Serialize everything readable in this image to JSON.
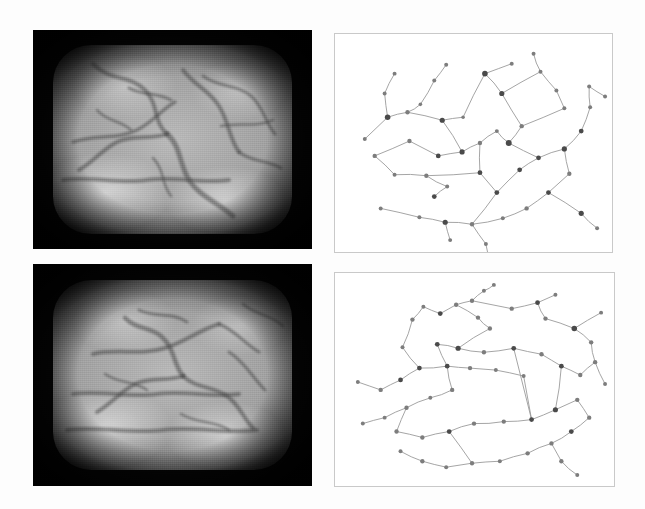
{
  "figure": {
    "background_color": "#fdfdfd",
    "layout": "2x2",
    "columns": 2,
    "rows": 2,
    "panels": [
      {
        "id": "top-left",
        "kind": "grayscale-image",
        "label": "top-left grayscale specimen image",
        "x": 33,
        "y": 30,
        "width": 279,
        "height": 219,
        "border_color": "#050505",
        "interior_color": "#a8a8a8"
      },
      {
        "id": "top-right",
        "kind": "graph",
        "label": "top-right extracted graph",
        "x": 334,
        "y": 33,
        "width": 279,
        "height": 220,
        "border_color": "#c9c9c9",
        "background_color": "#ffffff",
        "node_color": "#4a4a4a",
        "edge_color": "#9a9a9a"
      },
      {
        "id": "bottom-left",
        "kind": "grayscale-image",
        "label": "bottom-left grayscale specimen image",
        "x": 33,
        "y": 264,
        "width": 279,
        "height": 222,
        "border_color": "#050505",
        "interior_color": "#a8a8a8"
      },
      {
        "id": "bottom-right",
        "kind": "graph",
        "label": "bottom-right extracted graph",
        "x": 334,
        "y": 272,
        "width": 281,
        "height": 215,
        "border_color": "#c9c9c9",
        "background_color": "#ffffff",
        "node_color": "#4a4a4a",
        "edge_color": "#9a9a9a"
      }
    ]
  },
  "chart_data": [
    {
      "type": "scatter",
      "id": "top-right-graph",
      "title": "",
      "xlabel": "",
      "ylabel": "",
      "xlim": [
        0,
        279
      ],
      "ylim": [
        0,
        220
      ],
      "grid": false,
      "legend": "none",
      "nodes": [
        {
          "id": 0,
          "x": 30,
          "y": 106,
          "size": 2.0
        },
        {
          "id": 1,
          "x": 53,
          "y": 84,
          "size": 2.8
        },
        {
          "id": 2,
          "x": 50,
          "y": 60,
          "size": 2.0
        },
        {
          "id": 3,
          "x": 60,
          "y": 40,
          "size": 2.0
        },
        {
          "id": 4,
          "x": 73,
          "y": 79,
          "size": 2.2
        },
        {
          "id": 5,
          "x": 86,
          "y": 71,
          "size": 1.8
        },
        {
          "id": 6,
          "x": 100,
          "y": 47,
          "size": 2.0
        },
        {
          "id": 7,
          "x": 112,
          "y": 31,
          "size": 2.0
        },
        {
          "id": 8,
          "x": 108,
          "y": 87,
          "size": 2.6
        },
        {
          "id": 9,
          "x": 129,
          "y": 84,
          "size": 1.8
        },
        {
          "id": 10,
          "x": 151,
          "y": 40,
          "size": 2.8
        },
        {
          "id": 11,
          "x": 168,
          "y": 60,
          "size": 2.6
        },
        {
          "id": 12,
          "x": 178,
          "y": 30,
          "size": 2.0
        },
        {
          "id": 13,
          "x": 207,
          "y": 38,
          "size": 2.0
        },
        {
          "id": 14,
          "x": 223,
          "y": 57,
          "size": 2.0
        },
        {
          "id": 15,
          "x": 231,
          "y": 75,
          "size": 2.0
        },
        {
          "id": 16,
          "x": 188,
          "y": 93,
          "size": 2.2
        },
        {
          "id": 17,
          "x": 175,
          "y": 110,
          "size": 3.0
        },
        {
          "id": 18,
          "x": 163,
          "y": 98,
          "size": 2.0
        },
        {
          "id": 19,
          "x": 146,
          "y": 110,
          "size": 2.2
        },
        {
          "id": 20,
          "x": 128,
          "y": 119,
          "size": 2.6
        },
        {
          "id": 21,
          "x": 104,
          "y": 123,
          "size": 2.4
        },
        {
          "id": 22,
          "x": 75,
          "y": 108,
          "size": 2.2
        },
        {
          "id": 23,
          "x": 40,
          "y": 123,
          "size": 2.2
        },
        {
          "id": 24,
          "x": 60,
          "y": 142,
          "size": 2.0
        },
        {
          "id": 25,
          "x": 92,
          "y": 143,
          "size": 2.2
        },
        {
          "id": 26,
          "x": 113,
          "y": 154,
          "size": 2.0
        },
        {
          "id": 27,
          "x": 100,
          "y": 164,
          "size": 2.4
        },
        {
          "id": 28,
          "x": 146,
          "y": 140,
          "size": 2.4
        },
        {
          "id": 29,
          "x": 163,
          "y": 160,
          "size": 2.4
        },
        {
          "id": 30,
          "x": 186,
          "y": 137,
          "size": 2.4
        },
        {
          "id": 31,
          "x": 205,
          "y": 125,
          "size": 2.4
        },
        {
          "id": 32,
          "x": 231,
          "y": 116,
          "size": 2.6
        },
        {
          "id": 33,
          "x": 248,
          "y": 98,
          "size": 2.4
        },
        {
          "id": 34,
          "x": 257,
          "y": 74,
          "size": 2.0
        },
        {
          "id": 35,
          "x": 236,
          "y": 141,
          "size": 2.2
        },
        {
          "id": 36,
          "x": 215,
          "y": 160,
          "size": 2.4
        },
        {
          "id": 37,
          "x": 193,
          "y": 176,
          "size": 2.2
        },
        {
          "id": 38,
          "x": 169,
          "y": 186,
          "size": 2.0
        },
        {
          "id": 39,
          "x": 138,
          "y": 192,
          "size": 2.2
        },
        {
          "id": 40,
          "x": 111,
          "y": 190,
          "size": 2.6
        },
        {
          "id": 41,
          "x": 85,
          "y": 185,
          "size": 2.0
        },
        {
          "id": 42,
          "x": 46,
          "y": 176,
          "size": 2.0
        },
        {
          "id": 43,
          "x": 116,
          "y": 208,
          "size": 2.0
        },
        {
          "id": 44,
          "x": 152,
          "y": 212,
          "size": 2.0
        },
        {
          "id": 45,
          "x": 155,
          "y": 232,
          "size": 2.0
        },
        {
          "id": 46,
          "x": 248,
          "y": 181,
          "size": 2.6
        },
        {
          "id": 47,
          "x": 264,
          "y": 196,
          "size": 2.0
        },
        {
          "id": 48,
          "x": 256,
          "y": 53,
          "size": 2.0
        },
        {
          "id": 49,
          "x": 272,
          "y": 63,
          "size": 2.0
        },
        {
          "id": 50,
          "x": 200,
          "y": 20,
          "size": 2.0
        }
      ],
      "edges": [
        [
          0,
          1
        ],
        [
          1,
          2
        ],
        [
          2,
          3
        ],
        [
          1,
          4
        ],
        [
          4,
          5
        ],
        [
          5,
          6
        ],
        [
          6,
          7
        ],
        [
          4,
          8
        ],
        [
          8,
          9
        ],
        [
          9,
          10
        ],
        [
          10,
          11
        ],
        [
          10,
          12
        ],
        [
          11,
          13
        ],
        [
          13,
          14
        ],
        [
          14,
          15
        ],
        [
          15,
          16
        ],
        [
          11,
          16
        ],
        [
          16,
          17
        ],
        [
          17,
          18
        ],
        [
          18,
          19
        ],
        [
          19,
          20
        ],
        [
          20,
          21
        ],
        [
          21,
          22
        ],
        [
          22,
          23
        ],
        [
          23,
          24
        ],
        [
          24,
          25
        ],
        [
          25,
          26
        ],
        [
          26,
          27
        ],
        [
          25,
          28
        ],
        [
          28,
          29
        ],
        [
          29,
          30
        ],
        [
          30,
          31
        ],
        [
          31,
          32
        ],
        [
          32,
          33
        ],
        [
          33,
          34
        ],
        [
          34,
          48
        ],
        [
          48,
          49
        ],
        [
          32,
          35
        ],
        [
          35,
          36
        ],
        [
          36,
          37
        ],
        [
          37,
          38
        ],
        [
          38,
          39
        ],
        [
          39,
          40
        ],
        [
          40,
          41
        ],
        [
          41,
          42
        ],
        [
          40,
          43
        ],
        [
          39,
          44
        ],
        [
          44,
          45
        ],
        [
          36,
          46
        ],
        [
          46,
          47
        ],
        [
          17,
          31
        ],
        [
          8,
          20
        ],
        [
          13,
          50
        ],
        [
          28,
          19
        ],
        [
          29,
          39
        ]
      ]
    },
    {
      "type": "scatter",
      "id": "bottom-right-graph",
      "title": "",
      "xlabel": "",
      "ylabel": "",
      "xlim": [
        0,
        281
      ],
      "ylim": [
        0,
        215
      ],
      "grid": false,
      "legend": "none",
      "nodes": [
        {
          "id": 0,
          "x": 23,
          "y": 110,
          "size": 2.0
        },
        {
          "id": 1,
          "x": 46,
          "y": 118,
          "size": 2.2
        },
        {
          "id": 2,
          "x": 66,
          "y": 108,
          "size": 2.4
        },
        {
          "id": 3,
          "x": 85,
          "y": 96,
          "size": 2.4
        },
        {
          "id": 4,
          "x": 68,
          "y": 75,
          "size": 2.0
        },
        {
          "id": 5,
          "x": 78,
          "y": 47,
          "size": 2.2
        },
        {
          "id": 6,
          "x": 89,
          "y": 34,
          "size": 2.0
        },
        {
          "id": 7,
          "x": 106,
          "y": 41,
          "size": 2.4
        },
        {
          "id": 8,
          "x": 122,
          "y": 32,
          "size": 2.2
        },
        {
          "id": 9,
          "x": 138,
          "y": 28,
          "size": 2.2
        },
        {
          "id": 10,
          "x": 150,
          "y": 18,
          "size": 2.0
        },
        {
          "id": 11,
          "x": 144,
          "y": 45,
          "size": 2.2
        },
        {
          "id": 12,
          "x": 156,
          "y": 56,
          "size": 2.2
        },
        {
          "id": 13,
          "x": 178,
          "y": 36,
          "size": 2.2
        },
        {
          "id": 14,
          "x": 204,
          "y": 30,
          "size": 2.4
        },
        {
          "id": 15,
          "x": 222,
          "y": 22,
          "size": 2.0
        },
        {
          "id": 16,
          "x": 212,
          "y": 46,
          "size": 2.2
        },
        {
          "id": 17,
          "x": 241,
          "y": 56,
          "size": 2.8
        },
        {
          "id": 18,
          "x": 258,
          "y": 70,
          "size": 2.2
        },
        {
          "id": 19,
          "x": 262,
          "y": 90,
          "size": 2.2
        },
        {
          "id": 20,
          "x": 247,
          "y": 103,
          "size": 2.2
        },
        {
          "id": 21,
          "x": 228,
          "y": 94,
          "size": 2.4
        },
        {
          "id": 22,
          "x": 208,
          "y": 82,
          "size": 2.2
        },
        {
          "id": 23,
          "x": 180,
          "y": 76,
          "size": 2.4
        },
        {
          "id": 24,
          "x": 150,
          "y": 80,
          "size": 2.2
        },
        {
          "id": 25,
          "x": 124,
          "y": 76,
          "size": 2.6
        },
        {
          "id": 26,
          "x": 103,
          "y": 72,
          "size": 2.4
        },
        {
          "id": 27,
          "x": 113,
          "y": 94,
          "size": 2.4
        },
        {
          "id": 28,
          "x": 136,
          "y": 96,
          "size": 2.2
        },
        {
          "id": 29,
          "x": 162,
          "y": 98,
          "size": 2.0
        },
        {
          "id": 30,
          "x": 190,
          "y": 104,
          "size": 2.0
        },
        {
          "id": 31,
          "x": 118,
          "y": 118,
          "size": 2.2
        },
        {
          "id": 32,
          "x": 96,
          "y": 126,
          "size": 2.0
        },
        {
          "id": 33,
          "x": 72,
          "y": 136,
          "size": 2.2
        },
        {
          "id": 34,
          "x": 50,
          "y": 146,
          "size": 2.0
        },
        {
          "id": 35,
          "x": 28,
          "y": 152,
          "size": 2.0
        },
        {
          "id": 36,
          "x": 62,
          "y": 160,
          "size": 2.2
        },
        {
          "id": 37,
          "x": 88,
          "y": 166,
          "size": 2.2
        },
        {
          "id": 38,
          "x": 115,
          "y": 160,
          "size": 2.4
        },
        {
          "id": 39,
          "x": 140,
          "y": 152,
          "size": 2.2
        },
        {
          "id": 40,
          "x": 170,
          "y": 150,
          "size": 2.2
        },
        {
          "id": 41,
          "x": 198,
          "y": 148,
          "size": 2.4
        },
        {
          "id": 42,
          "x": 222,
          "y": 138,
          "size": 2.6
        },
        {
          "id": 43,
          "x": 244,
          "y": 128,
          "size": 2.2
        },
        {
          "id": 44,
          "x": 256,
          "y": 146,
          "size": 2.2
        },
        {
          "id": 45,
          "x": 238,
          "y": 160,
          "size": 2.4
        },
        {
          "id": 46,
          "x": 218,
          "y": 172,
          "size": 2.2
        },
        {
          "id": 47,
          "x": 194,
          "y": 182,
          "size": 2.2
        },
        {
          "id": 48,
          "x": 166,
          "y": 190,
          "size": 2.0
        },
        {
          "id": 49,
          "x": 138,
          "y": 192,
          "size": 2.2
        },
        {
          "id": 50,
          "x": 112,
          "y": 196,
          "size": 2.0
        },
        {
          "id": 51,
          "x": 88,
          "y": 190,
          "size": 2.2
        },
        {
          "id": 52,
          "x": 66,
          "y": 180,
          "size": 2.0
        },
        {
          "id": 53,
          "x": 228,
          "y": 190,
          "size": 2.2
        },
        {
          "id": 54,
          "x": 244,
          "y": 204,
          "size": 2.0
        },
        {
          "id": 55,
          "x": 272,
          "y": 112,
          "size": 2.0
        },
        {
          "id": 56,
          "x": 268,
          "y": 40,
          "size": 2.0
        },
        {
          "id": 57,
          "x": 160,
          "y": 12,
          "size": 2.0
        }
      ],
      "edges": [
        [
          0,
          1
        ],
        [
          1,
          2
        ],
        [
          2,
          3
        ],
        [
          3,
          4
        ],
        [
          4,
          5
        ],
        [
          5,
          6
        ],
        [
          6,
          7
        ],
        [
          7,
          8
        ],
        [
          8,
          9
        ],
        [
          9,
          10
        ],
        [
          8,
          11
        ],
        [
          11,
          12
        ],
        [
          9,
          13
        ],
        [
          13,
          14
        ],
        [
          14,
          15
        ],
        [
          14,
          16
        ],
        [
          16,
          17
        ],
        [
          17,
          18
        ],
        [
          18,
          19
        ],
        [
          19,
          20
        ],
        [
          20,
          21
        ],
        [
          21,
          22
        ],
        [
          22,
          23
        ],
        [
          23,
          24
        ],
        [
          24,
          25
        ],
        [
          25,
          26
        ],
        [
          26,
          27
        ],
        [
          27,
          28
        ],
        [
          28,
          29
        ],
        [
          29,
          30
        ],
        [
          30,
          41
        ],
        [
          27,
          31
        ],
        [
          31,
          32
        ],
        [
          32,
          33
        ],
        [
          33,
          34
        ],
        [
          34,
          35
        ],
        [
          33,
          36
        ],
        [
          36,
          37
        ],
        [
          37,
          38
        ],
        [
          38,
          39
        ],
        [
          39,
          40
        ],
        [
          40,
          41
        ],
        [
          41,
          42
        ],
        [
          42,
          43
        ],
        [
          43,
          44
        ],
        [
          44,
          45
        ],
        [
          45,
          46
        ],
        [
          46,
          47
        ],
        [
          47,
          48
        ],
        [
          48,
          49
        ],
        [
          49,
          50
        ],
        [
          50,
          51
        ],
        [
          51,
          52
        ],
        [
          46,
          53
        ],
        [
          53,
          54
        ],
        [
          19,
          55
        ],
        [
          17,
          56
        ],
        [
          10,
          57
        ],
        [
          12,
          25
        ],
        [
          23,
          41
        ],
        [
          21,
          42
        ],
        [
          3,
          27
        ],
        [
          38,
          49
        ]
      ]
    }
  ]
}
